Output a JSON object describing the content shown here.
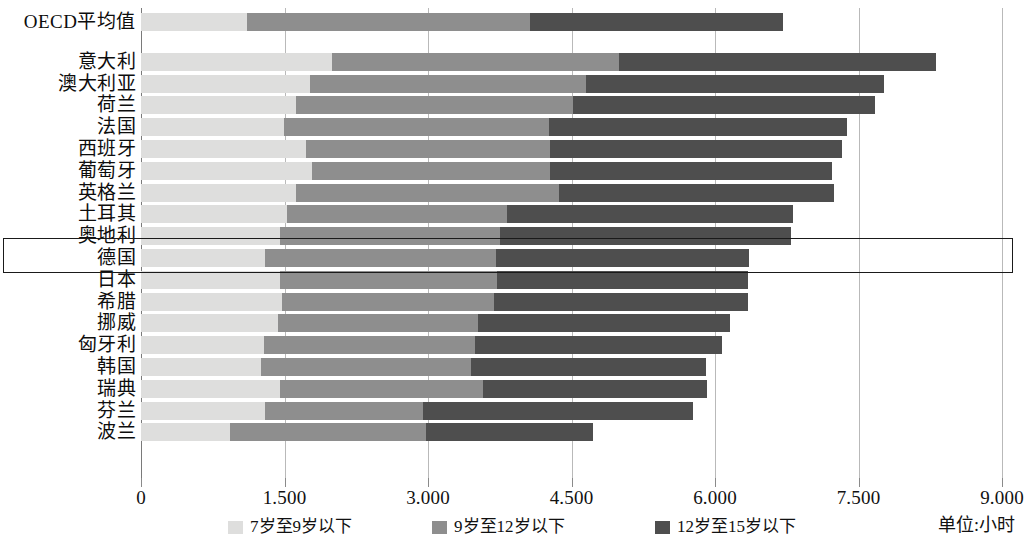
{
  "chart_data": {
    "type": "bar",
    "orientation": "horizontal",
    "stacked": true,
    "title": "",
    "xlabel": "",
    "ylabel": "",
    "unit_note": "单位:小时",
    "xlim": [
      0,
      9000
    ],
    "grid": true,
    "legend_position": "bottom",
    "xticks": [
      0,
      1500,
      3000,
      4500,
      6000,
      7500,
      9000
    ],
    "xtick_labels": [
      "0",
      "1.500",
      "3.000",
      "4.500",
      "6.000",
      "7.500",
      "9.000"
    ],
    "categories": [
      "OECD平均值",
      "意大利",
      "澳大利亚",
      "荷兰",
      "法国",
      "西班牙",
      "葡萄牙",
      "英格兰",
      "土耳其",
      "奥地利",
      "德国",
      "日本",
      "希腊",
      "挪威",
      "匈牙利",
      "韩国",
      "瑞典",
      "芬兰",
      "波兰"
    ],
    "series": [
      {
        "name": "7岁至9岁以下",
        "color": "#dededd",
        "values": [
          1110,
          1995,
          1770,
          1620,
          1495,
          1720,
          1790,
          1620,
          1525,
          1455,
          1295,
          1455,
          1470,
          1430,
          1290,
          1250,
          1450,
          1300,
          935
        ]
      },
      {
        "name": "9岁至12岁以下",
        "color": "#8e8e8e",
        "values": [
          2960,
          3000,
          2880,
          2900,
          2770,
          2560,
          2490,
          2750,
          2300,
          2300,
          2420,
          2270,
          2220,
          2090,
          2200,
          2200,
          2130,
          1650,
          2045
        ]
      },
      {
        "name": "12岁至15岁以下",
        "color": "#4e4e4e",
        "values": [
          2640,
          3315,
          3115,
          3150,
          3120,
          3045,
          2940,
          2870,
          2995,
          3035,
          2640,
          2620,
          2660,
          2640,
          2585,
          2460,
          2335,
          2825,
          1740
        ]
      }
    ],
    "totals": [
      6710,
      8310,
      7765,
      7670,
      7385,
      7325,
      7220,
      7240,
      6820,
      6790,
      6355,
      6345,
      6350,
      6160,
      6075,
      5910,
      5915,
      5775,
      4720
    ],
    "highlighted_category": "德国"
  },
  "legend": {
    "items": [
      {
        "label": "7岁至9岁以下",
        "color": "#dededd"
      },
      {
        "label": "9岁至12岁以下",
        "color": "#8e8e8e"
      },
      {
        "label": "12岁至15岁以下",
        "color": "#4e4e4e"
      }
    ]
  },
  "axis": {
    "unit": "单位:小时"
  }
}
